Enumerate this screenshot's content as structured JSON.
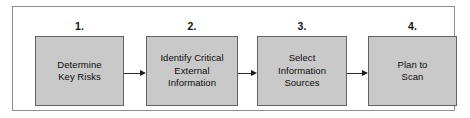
{
  "diagram": {
    "type": "process-flow",
    "orientation": "horizontal",
    "colors": {
      "box_fill": "#c9c9c9",
      "box_border": "#636363",
      "frame_border": "#8e8e8e",
      "background": "#ffffff",
      "arrow": "#1a1a1a",
      "text": "#0d0d0d"
    },
    "steps": [
      {
        "number": "1.",
        "label": "Determine\nKey Risks"
      },
      {
        "number": "2.",
        "label": "Identify Critical\nExternal\nInformation"
      },
      {
        "number": "3.",
        "label": "Select\nInformation\nSources"
      },
      {
        "number": "4.",
        "label": "Plan to\nScan"
      }
    ],
    "connectors": [
      {
        "name": "arrow-step-1-to-2",
        "from": "1",
        "to": "2"
      },
      {
        "name": "arrow-step-2-to-3",
        "from": "2",
        "to": "3"
      },
      {
        "name": "arrow-step-3-to-4",
        "from": "3",
        "to": "4"
      }
    ]
  }
}
